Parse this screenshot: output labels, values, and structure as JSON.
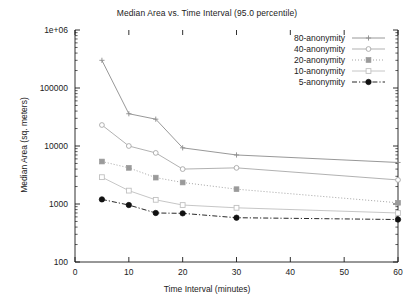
{
  "chart_data": {
    "type": "line",
    "title": "Median Area vs. Time Interval (95.0 percentile)",
    "xlabel": "Time Interval (minutes)",
    "ylabel": "Median Area (sq. meters)",
    "yscale": "log",
    "xlim": [
      0,
      60
    ],
    "ylim": [
      100,
      1000000
    ],
    "xticks": [
      0,
      10,
      20,
      30,
      40,
      50,
      60
    ],
    "xtick_labels": [
      "0",
      "10",
      "20",
      "30",
      "40",
      "50",
      "60"
    ],
    "yticks": [
      100,
      1000,
      10000,
      100000,
      1000000
    ],
    "ytick_labels": [
      "100",
      "1000",
      "10000",
      "100000",
      "1e+06"
    ],
    "grid": false,
    "legend_position": "top-right",
    "x": [
      5,
      10,
      15,
      20,
      30,
      60
    ],
    "series": [
      {
        "name": "80-anonymity",
        "marker": "plus",
        "linestyle": "solid",
        "color": "#8c8c8c",
        "values": [
          300000,
          36000,
          29000,
          9300,
          7000,
          5200
        ]
      },
      {
        "name": "40-anonymity",
        "marker": "circle-open-small",
        "linestyle": "solid",
        "color": "#a8a8a8",
        "values": [
          23000,
          10000,
          7600,
          4000,
          4200,
          2600
        ]
      },
      {
        "name": "20-anonymity",
        "marker": "square-filled",
        "linestyle": "dotted",
        "color": "#9a9a9a",
        "values": [
          5400,
          4200,
          2850,
          2350,
          1800,
          1050
        ]
      },
      {
        "name": "10-anonymity",
        "marker": "square-open",
        "linestyle": "solid",
        "color": "#c0c0c0",
        "values": [
          2900,
          1700,
          1180,
          960,
          860,
          700
        ]
      },
      {
        "name": "5-anonymity",
        "marker": "circle-filled",
        "linestyle": "dash-dot",
        "color": "#111111",
        "values": [
          1200,
          960,
          700,
          690,
          580,
          540
        ]
      }
    ]
  },
  "legend": {
    "items": [
      {
        "label": "80-anonymity"
      },
      {
        "label": "40-anonymity"
      },
      {
        "label": "20-anonymity"
      },
      {
        "label": "10-anonymity"
      },
      {
        "label": "5-anonymity"
      }
    ]
  },
  "colors": {
    "axis": "#1a1a1a",
    "background": "#ffffff",
    "text": "#222222"
  }
}
